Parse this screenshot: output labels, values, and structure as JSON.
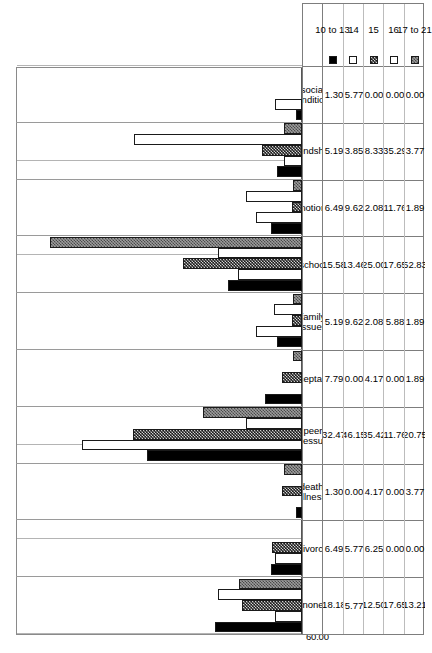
{
  "chart_data": {
    "type": "bar",
    "orientation": "horizontal",
    "title": "",
    "xlabel": "",
    "ylabel": "",
    "grid": true,
    "legend_position": "bottom-left-table",
    "value_axis": {
      "min": 0,
      "max": 60,
      "step": 10,
      "reversed": true,
      "ticks": [
        "60.00",
        "50.00",
        "40.00",
        "30.00",
        "20.00",
        "10.00",
        "0.00"
      ],
      "tick_values": [
        60,
        50,
        40,
        30,
        20,
        10,
        0
      ]
    },
    "categories": [
      "none",
      "divorce",
      "death/\nillness",
      "peer\npressure",
      "acceptance",
      "family\nissues",
      "school",
      "emotional",
      "friendships",
      "social\nconditions"
    ],
    "series": [
      {
        "name": "10 to 13",
        "pattern": "solid-black",
        "values": [
          18.18,
          6.49,
          1.3,
          32.47,
          7.79,
          5.19,
          15.58,
          6.49,
          5.19,
          1.3
        ]
      },
      {
        "name": "14",
        "pattern": "white",
        "values": [
          5.77,
          5.77,
          0.0,
          46.15,
          0.0,
          9.62,
          13.46,
          9.62,
          3.85,
          5.77
        ]
      },
      {
        "name": "15",
        "pattern": "dark-checker",
        "values": [
          12.5,
          6.25,
          4.17,
          35.42,
          4.17,
          2.08,
          25.0,
          2.08,
          8.33,
          0.0
        ]
      },
      {
        "name": "16",
        "pattern": "light-dots",
        "values": [
          17.65,
          0.0,
          0.0,
          11.76,
          0.0,
          5.88,
          17.65,
          11.76,
          35.29,
          0.0
        ]
      },
      {
        "name": "17 to 21",
        "pattern": "gray-checker",
        "values": [
          13.21,
          0.0,
          3.77,
          20.75,
          1.89,
          1.89,
          52.83,
          1.89,
          3.77,
          0.0
        ]
      }
    ],
    "data_table": {
      "row_headers": [
        "10 to 13",
        "14",
        "15",
        "16",
        "17 to 21"
      ],
      "column_headers": [
        "none",
        "divorce",
        "death/\nillness",
        "peer\npressure",
        "acceptance",
        "family\nissues",
        "school",
        "emotional",
        "friendships",
        "social\nconditions"
      ],
      "rows": [
        [
          "18.18",
          "6.49",
          "1.30",
          "32.47",
          "7.79",
          "5.19",
          "15.58",
          "6.49",
          "5.19",
          "1.30"
        ],
        [
          "5.77",
          "5.77",
          "0.00",
          "46.15",
          "0.00",
          "9.62",
          "13.46",
          "9.62",
          "3.85",
          "5.77"
        ],
        [
          "12.50",
          "6.25",
          "4.17",
          "35.42",
          "4.17",
          "2.08",
          "25.00",
          "2.08",
          "8.33",
          "0.00"
        ],
        [
          "17.65",
          "0.00",
          "0.00",
          "11.76",
          "0.00",
          "5.88",
          "17.65",
          "11.76",
          "35.29",
          "0.00"
        ],
        [
          "13.21",
          "0.00",
          "3.77",
          "20.75",
          "1.89",
          "1.89",
          "52.83",
          "1.89",
          "3.77",
          "0.00"
        ]
      ]
    }
  }
}
